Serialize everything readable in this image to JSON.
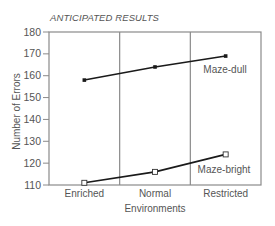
{
  "chart_data": {
    "type": "line",
    "title": "ANTICIPATED RESULTS",
    "xlabel": "Environments",
    "ylabel": "Number of Errors",
    "categories": [
      "Enriched",
      "Normal",
      "Restricted"
    ],
    "series": [
      {
        "name": "Maze-dull",
        "values": [
          158,
          164,
          169
        ],
        "marker": "filled-square"
      },
      {
        "name": "Maze-bright",
        "values": [
          111,
          116,
          124
        ],
        "marker": "open-square"
      }
    ],
    "ylim": [
      110,
      180
    ],
    "yticks": [
      110,
      120,
      130,
      140,
      150,
      160,
      170,
      180
    ],
    "grid": "vertical category dividers",
    "legend": "inline labels"
  },
  "colors": {
    "line": "#1a1a1a",
    "frame": "#8a8a8a",
    "text": "#555555"
  }
}
